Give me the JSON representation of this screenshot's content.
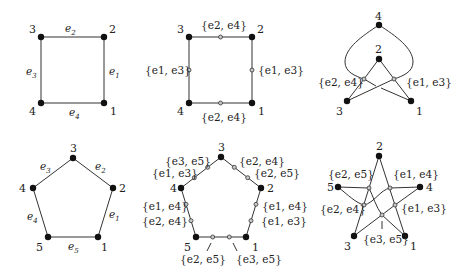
{
  "figure": {
    "panels": [
      {
        "id": "square",
        "vertices": [
          {
            "label": "1",
            "x": 104,
            "y": 103
          },
          {
            "label": "2",
            "x": 104,
            "y": 37
          },
          {
            "label": "3",
            "x": 41,
            "y": 37
          },
          {
            "label": "4",
            "x": 41,
            "y": 103
          }
        ],
        "edge_labels": [
          "e1",
          "e2",
          "e3",
          "e4"
        ]
      },
      {
        "id": "square-subdivided",
        "vertices": [
          "1",
          "2",
          "3",
          "4"
        ],
        "set_labels": {
          "top": "{e2, e4}",
          "bottom": "{e2, e4}",
          "left": "{e1, e3}",
          "right": "{e1, e3}"
        }
      },
      {
        "id": "square-folded",
        "vertices": [
          "4",
          "2",
          "3",
          "1"
        ],
        "set_labels": {
          "left": "{e2, e4}",
          "right": "{e1, e3}"
        }
      },
      {
        "id": "pentagon",
        "vertices": [
          "1",
          "2",
          "3",
          "4",
          "5"
        ],
        "edge_labels": [
          "e1",
          "e2",
          "e3",
          "e4",
          "e5"
        ]
      },
      {
        "id": "pentagon-subdivided",
        "vertices": [
          "1",
          "2",
          "3",
          "4",
          "5"
        ],
        "set_labels": {
          "edge_3_4_upper": "{e3, e5}",
          "edge_3_4_lower": "{e1, e3}",
          "edge_3_2_upper": "{e2, e4}",
          "edge_3_2_lower": "{e2, e5}",
          "edge_4_5_upper": "{e1, e4}",
          "edge_4_5_lower": "{e2, e4}",
          "edge_2_1_upper": "{e1, e4}",
          "edge_2_1_lower": "{e1, e3}",
          "edge_5_1_left": "{e2, e5}",
          "edge_5_1_right": "{e3, e5}"
        }
      },
      {
        "id": "pentagram",
        "vertices": [
          "2",
          "4",
          "1",
          "3",
          "5"
        ],
        "set_labels": {
          "upper_left": "{e2, e5}",
          "upper_right": "{e1, e4}",
          "mid_left": "{e2, e4}",
          "mid_right": "{e1, e3}",
          "bottom": "{e3, e5}"
        }
      }
    ]
  },
  "text": {
    "v1": "1",
    "v2": "2",
    "v3": "3",
    "v4": "4",
    "v5": "5",
    "e": "e",
    "sub1": "1",
    "sub2": "2",
    "sub3": "3",
    "sub4": "4",
    "sub5": "5",
    "s24": "{e2, e4}",
    "s13": "{e1, e3}",
    "s35": "{e3, e5}",
    "s25": "{e2, e5}",
    "s14": "{e1, e4}"
  },
  "colors": {
    "vertex": "#111111",
    "open_vertex_fill": "#c8c8c8",
    "edge": "#333333",
    "text": "#222222"
  }
}
